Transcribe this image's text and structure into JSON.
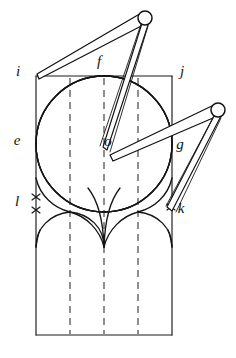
{
  "figure": {
    "canvas": {
      "width": 236,
      "height": 358
    },
    "ink_color": "#1a1a1a",
    "background_color": "#ffffff"
  },
  "labels": {
    "i": {
      "text": "i",
      "x": 18,
      "y": 76
    },
    "j": {
      "text": "j",
      "x": 182,
      "y": 76
    },
    "e": {
      "text": "e",
      "x": 17,
      "y": 145
    },
    "o": {
      "text": "o",
      "x": 108,
      "y": 146
    },
    "f": {
      "text": "f",
      "x": 99,
      "y": 66
    },
    "g": {
      "text": "g",
      "x": 180,
      "y": 149
    },
    "k": {
      "text": "k",
      "x": 181,
      "y": 213
    },
    "l": {
      "text": "l",
      "x": 17,
      "y": 206
    }
  },
  "geometry": {
    "square": {
      "left": 36,
      "top": 76,
      "right": 172,
      "bottom": 212,
      "side": 136
    },
    "outer_rect_bottom": 335,
    "circle": {
      "cx": 104,
      "cy": 144,
      "r": 68
    },
    "midpoints": {
      "top_f": {
        "x": 104,
        "y": 76
      },
      "left_e": {
        "x": 36,
        "y": 144
      },
      "right_g": {
        "x": 172,
        "y": 144
      },
      "bottom": {
        "x": 104,
        "y": 212
      }
    },
    "center_o": {
      "x": 104,
      "y": 144
    },
    "dashed_lines_x": [
      70,
      104,
      138
    ],
    "dashed_top": 76,
    "dashed_bottom": 335,
    "arch_springline_y": 212,
    "arch_base_y": 247,
    "tick_marks": [
      {
        "name": "tick-l-upper",
        "x": 36,
        "y": 197
      },
      {
        "name": "tick-l-lower",
        "x": 36,
        "y": 210
      },
      {
        "name": "tick-k",
        "x": 171,
        "y": 207
      }
    ]
  },
  "compasses": [
    {
      "name": "upper-compass",
      "pivot": {
        "x": 145,
        "y": 18,
        "r": 7
      },
      "point_a": {
        "x": 38,
        "y": 76
      },
      "point_b": {
        "x": 105,
        "y": 148
      },
      "description": "divider with head at upper right, legs reaching corner i and interior"
    },
    {
      "name": "lower-compass",
      "pivot": {
        "x": 218,
        "y": 110,
        "r": 7
      },
      "point_a": {
        "x": 112,
        "y": 158
      },
      "point_b": {
        "x": 170,
        "y": 208
      },
      "description": "divider with head at right, legs reaching center region and point k"
    }
  ]
}
